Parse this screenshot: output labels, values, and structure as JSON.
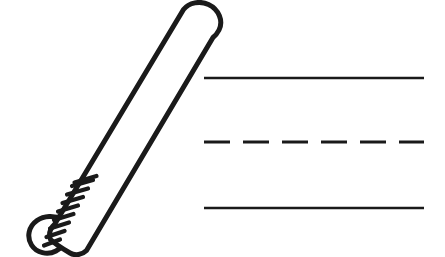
{
  "worksheet": {
    "title": "Baseball Bat Tracing Worksheet",
    "background_color": "#ffffff",
    "ink_color": "#1a1a1a",
    "width": 445,
    "height": 257
  },
  "illustration": {
    "name": "baseball-bat",
    "style": "black-and-white line art outline",
    "description": "Outlined baseball bat angled from lower left to upper right",
    "stroke_color": "#1a1a1a",
    "fill_color": "#ffffff",
    "stroke_width": 5,
    "angle_degrees": -57,
    "parts": [
      {
        "name": "barrel",
        "label": "Barrel"
      },
      {
        "name": "taper",
        "label": "Taper"
      },
      {
        "name": "grip-tape",
        "label": "Grip Tape"
      },
      {
        "name": "knob",
        "label": "Knob"
      }
    ],
    "grip_tape_stripe_count": 8
  },
  "guide_lines": {
    "label": "Handwriting practice guide lines",
    "left_x": 204,
    "right_x": 424,
    "color": "#1a1a1a",
    "lines": [
      {
        "name": "top-line",
        "label": "Top Line",
        "style": "solid",
        "y": 78,
        "thickness": 2.6
      },
      {
        "name": "middle-line",
        "label": "Middle Dashed Line",
        "style": "dashed",
        "y": 142,
        "thickness": 3.2,
        "dash": "26 13"
      },
      {
        "name": "bottom-line",
        "label": "Bottom Line",
        "style": "solid",
        "y": 208,
        "thickness": 2.6
      }
    ]
  },
  "writing_area": {
    "name": "tracing-area",
    "placeholder": "",
    "value": ""
  }
}
